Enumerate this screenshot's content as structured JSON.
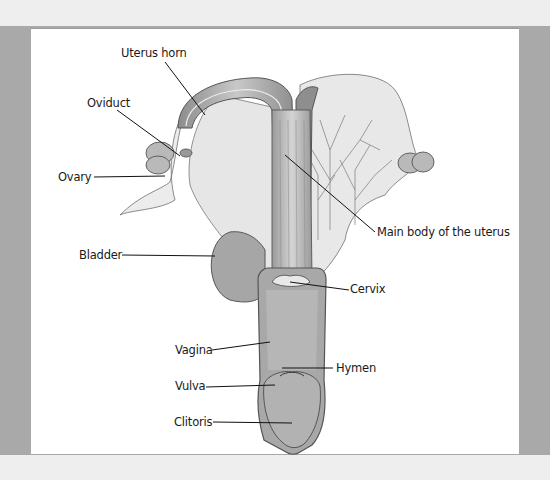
{
  "diagram": {
    "labels": [
      {
        "id": "uterus_horn",
        "text": "Uterus horn"
      },
      {
        "id": "oviduct",
        "text": "Oviduct"
      },
      {
        "id": "ovary",
        "text": "Ovary"
      },
      {
        "id": "main_body",
        "text": "Main body of the uterus"
      },
      {
        "id": "bladder",
        "text": "Bladder"
      },
      {
        "id": "cervix",
        "text": "Cervix"
      },
      {
        "id": "vagina",
        "text": "Vagina"
      },
      {
        "id": "hymen",
        "text": "Hymen"
      },
      {
        "id": "vulva",
        "text": "Vulva"
      },
      {
        "id": "clitoris",
        "text": "Clitoris"
      }
    ]
  },
  "colors": {
    "background": "#eeeeee",
    "frame_band": "#a9a9a9",
    "panel": "#ffffff",
    "ink": "#1a1a1a"
  }
}
